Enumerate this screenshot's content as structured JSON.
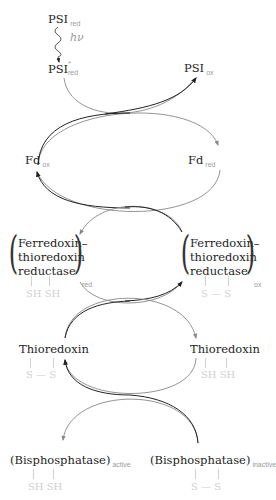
{
  "diagram": {
    "light": "hν",
    "nodes": {
      "psi_red": {
        "name": "PSI",
        "sub": "red"
      },
      "psi_excited": {
        "name": "PSI",
        "sup": "*",
        "sub": "red"
      },
      "psi_ox": {
        "name": "PSI",
        "sub": "ox"
      },
      "fd_ox": {
        "name": "Fd",
        "sub": "ox"
      },
      "fd_red": {
        "name": "Fd",
        "sub": "red"
      },
      "ftr_red": {
        "line1": "Ferredoxin–",
        "line2": "thioredoxin",
        "line3": "reductase",
        "sub": "red",
        "thiol": "SH  SH"
      },
      "ftr_ox": {
        "line1": "Ferredoxin–",
        "line2": "thioredoxin",
        "line3": "reductase",
        "sub": "ox",
        "thiol": "S — S"
      },
      "trx_left": {
        "name": "Thioredoxin",
        "thiol": "S — S"
      },
      "trx_right": {
        "name": "Thioredoxin",
        "thiol": "SH  SH"
      },
      "bpase_active": {
        "name": "(Bisphosphatase)",
        "sub": "active",
        "thiol": "SH  SH"
      },
      "bpase_inactive": {
        "name": "(Bisphosphatase)",
        "sub": "inactive",
        "thiol": "S — S"
      }
    },
    "colors": {
      "dark_arrow": "#222222",
      "light_arrow": "#8a8a8a",
      "subscript": "#9a9a9a",
      "thiol": "#cfcfcf"
    }
  }
}
